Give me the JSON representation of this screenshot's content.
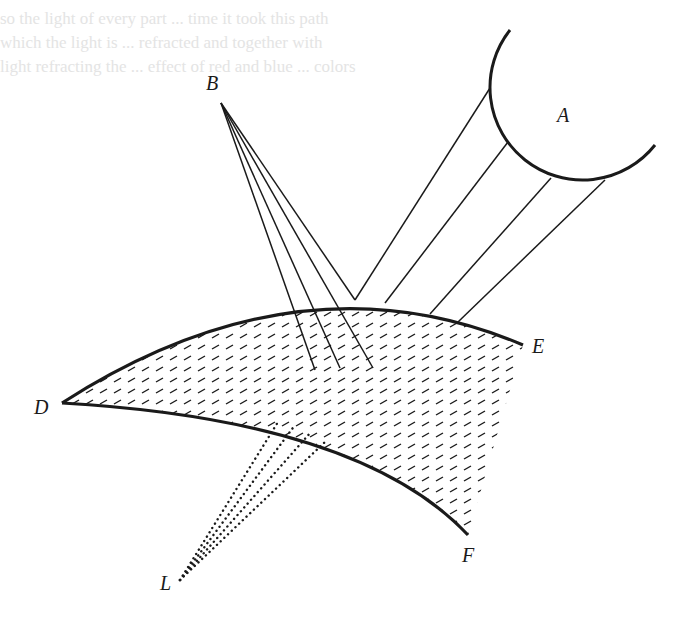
{
  "figure": {
    "type": "optics-diagram",
    "labels": {
      "A": "A",
      "B": "B",
      "D": "D",
      "E": "E",
      "F": "F",
      "L": "L"
    },
    "elements": {
      "source_A": {
        "kind": "circular-arc",
        "label": "A"
      },
      "point_B": {
        "kind": "point",
        "label": "B",
        "ray_count": 4
      },
      "medium": {
        "kind": "hatched-lens",
        "corners": [
          "D",
          "E",
          "F"
        ]
      },
      "rays_from_A": {
        "count": 4,
        "style": "solid"
      },
      "rays_to_L": {
        "count": 4,
        "style": "dotted",
        "label": "L"
      }
    },
    "colors": {
      "ink": "#1a1a1a",
      "paper": "#ffffff",
      "bleed_through": "#e4e4e4"
    }
  },
  "bleed_text": {
    "lines": [
      "so the light of every part ... time it took this path",
      "which the light is ... refracted and together with",
      "light refracting the ... effect of red and blue ... colors"
    ]
  }
}
